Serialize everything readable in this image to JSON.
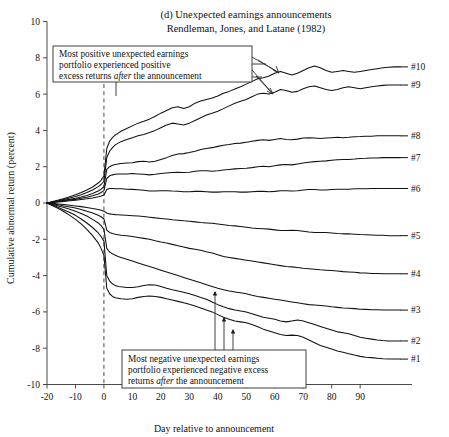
{
  "figure": {
    "panel_label": "(d) Unexpected earnings announcements",
    "citation": "Rendleman, Jones, and Latane (1982)"
  },
  "annotations": {
    "positive": {
      "line1": "Most positive unexpected earnings",
      "line2": "portfolio experienced positive",
      "line3_a": "excess returns ",
      "line3_em": "after",
      "line3_b": " the announcement"
    },
    "negative": {
      "line1": "Most negative unexpected earnings",
      "line2": "portfolio experienced negative excess",
      "line3_a": "returns ",
      "line3_em": "after",
      "line3_b": " the announcement"
    }
  },
  "chart_data": {
    "type": "line",
    "title": "(d) Unexpected earnings announcements",
    "subtitle": "Rendleman, Jones, and Latane (1982)",
    "xlabel": "Day relative to announcement",
    "ylabel": "Cumulative abnormal return (percent)",
    "xlim": [
      -20,
      104
    ],
    "ylim": [
      -10,
      10
    ],
    "xticks": [
      -20,
      -10,
      0,
      10,
      20,
      30,
      40,
      50,
      60,
      70,
      80,
      90
    ],
    "yticks": [
      -10,
      -8,
      -6,
      -4,
      -2,
      0,
      2,
      4,
      6,
      8,
      10
    ],
    "grid": false,
    "legend_position": "right-of-axis-inline",
    "event_marker": {
      "x": 0,
      "style": "dashed-vertical",
      "label": "announcement day"
    },
    "x": [
      -20,
      -18,
      -16,
      -14,
      -12,
      -10,
      -8,
      -6,
      -4,
      -2,
      -1,
      0,
      1,
      2,
      3,
      4,
      5,
      6,
      8,
      10,
      12,
      14,
      16,
      18,
      20,
      22,
      24,
      26,
      28,
      30,
      32,
      34,
      36,
      38,
      40,
      42,
      44,
      46,
      48,
      50,
      52,
      54,
      56,
      58,
      60,
      62,
      64,
      66,
      68,
      70,
      72,
      74,
      76,
      78,
      80,
      82,
      84,
      86,
      88,
      90,
      92,
      94,
      96,
      98,
      100,
      102,
      104
    ],
    "series": [
      {
        "name": "#10",
        "label": "#10",
        "end_value": 7.5,
        "values": [
          0.0,
          0.08,
          0.16,
          0.25,
          0.35,
          0.45,
          0.58,
          0.72,
          0.88,
          1.1,
          1.25,
          1.5,
          3.0,
          3.4,
          3.6,
          3.75,
          3.85,
          3.95,
          4.1,
          4.25,
          4.4,
          4.5,
          4.62,
          4.78,
          4.95,
          5.1,
          5.25,
          5.3,
          5.2,
          5.3,
          5.5,
          5.62,
          5.7,
          5.78,
          5.9,
          6.05,
          6.15,
          6.28,
          6.4,
          6.55,
          6.7,
          6.85,
          6.9,
          7.0,
          7.15,
          7.25,
          7.15,
          7.05,
          7.15,
          7.3,
          7.45,
          7.55,
          7.45,
          7.3,
          7.2,
          7.25,
          7.3,
          7.25,
          7.2,
          7.25,
          7.3,
          7.35,
          7.4,
          7.45,
          7.48,
          7.5,
          7.5
        ]
      },
      {
        "name": "#9",
        "label": "#9",
        "end_value": 6.5,
        "values": [
          0.0,
          0.06,
          0.12,
          0.2,
          0.28,
          0.36,
          0.46,
          0.58,
          0.72,
          0.9,
          1.02,
          1.2,
          2.5,
          2.85,
          3.05,
          3.2,
          3.3,
          3.38,
          3.5,
          3.6,
          3.7,
          3.78,
          3.88,
          4.0,
          4.15,
          4.3,
          4.4,
          4.35,
          4.3,
          4.4,
          4.55,
          4.7,
          4.85,
          4.95,
          5.05,
          5.2,
          5.35,
          5.5,
          5.6,
          5.7,
          5.85,
          6.0,
          6.05,
          6.0,
          6.1,
          6.25,
          6.2,
          6.1,
          6.15,
          6.3,
          6.4,
          6.45,
          6.35,
          6.25,
          6.2,
          6.25,
          6.35,
          6.4,
          6.35,
          6.3,
          6.35,
          6.4,
          6.45,
          6.48,
          6.5,
          6.5,
          6.5
        ]
      },
      {
        "name": "#8",
        "label": "#8",
        "end_value": 3.7,
        "values": [
          0.0,
          0.05,
          0.1,
          0.15,
          0.2,
          0.26,
          0.33,
          0.42,
          0.52,
          0.66,
          0.76,
          0.9,
          1.85,
          2.0,
          2.08,
          2.12,
          2.15,
          2.18,
          2.2,
          2.22,
          2.28,
          2.3,
          2.26,
          2.3,
          2.4,
          2.5,
          2.62,
          2.7,
          2.72,
          2.78,
          2.85,
          2.95,
          3.0,
          3.05,
          3.12,
          3.18,
          3.22,
          3.28,
          3.3,
          3.35,
          3.4,
          3.45,
          3.48,
          3.45,
          3.5,
          3.55,
          3.5,
          3.48,
          3.52,
          3.58,
          3.6,
          3.58,
          3.55,
          3.58,
          3.6,
          3.62,
          3.6,
          3.62,
          3.65,
          3.66,
          3.68,
          3.68,
          3.7,
          3.7,
          3.7,
          3.7,
          3.7
        ]
      },
      {
        "name": "#7",
        "label": "#7",
        "end_value": 2.5,
        "values": [
          0.0,
          0.04,
          0.08,
          0.12,
          0.16,
          0.2,
          0.26,
          0.32,
          0.4,
          0.5,
          0.58,
          0.68,
          1.35,
          1.5,
          1.55,
          1.58,
          1.6,
          1.6,
          1.6,
          1.62,
          1.6,
          1.58,
          1.55,
          1.58,
          1.62,
          1.65,
          1.68,
          1.7,
          1.68,
          1.7,
          1.75,
          1.78,
          1.78,
          1.75,
          1.78,
          1.82,
          1.85,
          1.88,
          1.9,
          1.92,
          1.95,
          2.0,
          2.02,
          2.0,
          2.05,
          2.1,
          2.12,
          2.1,
          2.15,
          2.2,
          2.25,
          2.28,
          2.3,
          2.32,
          2.35,
          2.38,
          2.4,
          2.4,
          2.42,
          2.45,
          2.46,
          2.48,
          2.48,
          2.5,
          2.5,
          2.5,
          2.5
        ]
      },
      {
        "name": "#6",
        "label": "#6",
        "end_value": 0.8,
        "values": [
          0.0,
          0.03,
          0.06,
          0.09,
          0.12,
          0.15,
          0.19,
          0.23,
          0.28,
          0.34,
          0.38,
          0.44,
          0.75,
          0.8,
          0.8,
          0.78,
          0.78,
          0.78,
          0.76,
          0.75,
          0.73,
          0.7,
          0.66,
          0.66,
          0.68,
          0.68,
          0.66,
          0.65,
          0.62,
          0.62,
          0.64,
          0.64,
          0.62,
          0.6,
          0.6,
          0.62,
          0.62,
          0.62,
          0.6,
          0.6,
          0.62,
          0.64,
          0.64,
          0.62,
          0.64,
          0.68,
          0.68,
          0.66,
          0.68,
          0.72,
          0.74,
          0.74,
          0.72,
          0.72,
          0.74,
          0.76,
          0.76,
          0.76,
          0.78,
          0.78,
          0.78,
          0.8,
          0.8,
          0.8,
          0.8,
          0.8,
          0.8
        ]
      },
      {
        "name": "#5",
        "label": "#5",
        "end_value": -1.8,
        "values": [
          0.0,
          -0.02,
          -0.05,
          -0.08,
          -0.12,
          -0.16,
          -0.2,
          -0.25,
          -0.3,
          -0.36,
          -0.4,
          -0.45,
          -0.55,
          -0.6,
          -0.62,
          -0.64,
          -0.65,
          -0.66,
          -0.68,
          -0.7,
          -0.72,
          -0.74,
          -0.78,
          -0.82,
          -0.85,
          -0.88,
          -0.92,
          -0.95,
          -0.98,
          -1.0,
          -1.04,
          -1.08,
          -1.1,
          -1.12,
          -1.16,
          -1.2,
          -1.24,
          -1.26,
          -1.3,
          -1.34,
          -1.38,
          -1.4,
          -1.42,
          -1.44,
          -1.48,
          -1.52,
          -1.52,
          -1.5,
          -1.52,
          -1.56,
          -1.6,
          -1.62,
          -1.62,
          -1.62,
          -1.65,
          -1.68,
          -1.7,
          -1.7,
          -1.72,
          -1.74,
          -1.75,
          -1.76,
          -1.78,
          -1.78,
          -1.8,
          -1.8,
          -1.8
        ]
      },
      {
        "name": "#4",
        "label": "#4",
        "end_value": -3.9,
        "values": [
          0.0,
          -0.05,
          -0.1,
          -0.16,
          -0.22,
          -0.28,
          -0.36,
          -0.45,
          -0.55,
          -0.68,
          -0.76,
          -0.88,
          -1.5,
          -1.62,
          -1.68,
          -1.72,
          -1.75,
          -1.78,
          -1.8,
          -1.85,
          -1.9,
          -1.95,
          -2.0,
          -2.08,
          -2.15,
          -2.2,
          -2.28,
          -2.35,
          -2.42,
          -2.5,
          -2.55,
          -2.6,
          -2.68,
          -2.75,
          -2.85,
          -2.95,
          -3.0,
          -3.05,
          -3.1,
          -3.15,
          -3.2,
          -3.25,
          -3.3,
          -3.35,
          -3.4,
          -3.45,
          -3.5,
          -3.52,
          -3.55,
          -3.6,
          -3.62,
          -3.65,
          -3.68,
          -3.7,
          -3.72,
          -3.75,
          -3.78,
          -3.8,
          -3.82,
          -3.85,
          -3.86,
          -3.88,
          -3.88,
          -3.9,
          -3.9,
          -3.9,
          -3.9
        ]
      },
      {
        "name": "#3",
        "label": "#3",
        "end_value": -5.9,
        "values": [
          0.0,
          -0.08,
          -0.16,
          -0.25,
          -0.35,
          -0.45,
          -0.58,
          -0.72,
          -0.9,
          -1.1,
          -1.25,
          -1.45,
          -2.5,
          -2.7,
          -2.8,
          -2.88,
          -2.95,
          -3.0,
          -3.1,
          -3.2,
          -3.3,
          -3.4,
          -3.5,
          -3.6,
          -3.7,
          -3.8,
          -3.9,
          -4.0,
          -4.1,
          -4.2,
          -4.3,
          -4.4,
          -4.5,
          -4.6,
          -4.7,
          -4.78,
          -4.85,
          -4.9,
          -4.95,
          -5.0,
          -5.08,
          -5.15,
          -5.2,
          -5.25,
          -5.3,
          -5.35,
          -5.4,
          -5.45,
          -5.5,
          -5.55,
          -5.6,
          -5.62,
          -5.65,
          -5.68,
          -5.72,
          -5.75,
          -5.78,
          -5.8,
          -5.82,
          -5.85,
          -5.86,
          -5.88,
          -5.88,
          -5.9,
          -5.9,
          -5.9,
          -5.9
        ]
      },
      {
        "name": "#2",
        "label": "#2",
        "end_value": -7.6,
        "values": [
          0.0,
          -0.12,
          -0.24,
          -0.38,
          -0.52,
          -0.68,
          -0.88,
          -1.1,
          -1.35,
          -1.65,
          -1.85,
          -2.1,
          -4.0,
          -4.3,
          -4.45,
          -4.55,
          -4.6,
          -4.62,
          -4.65,
          -4.66,
          -4.62,
          -4.55,
          -4.5,
          -4.52,
          -4.6,
          -4.7,
          -4.78,
          -4.85,
          -4.92,
          -5.0,
          -5.1,
          -5.2,
          -5.3,
          -5.45,
          -5.6,
          -5.72,
          -5.82,
          -5.9,
          -5.95,
          -6.0,
          -6.1,
          -6.2,
          -6.3,
          -6.35,
          -6.4,
          -6.5,
          -6.55,
          -6.5,
          -6.45,
          -6.5,
          -6.6,
          -6.7,
          -6.8,
          -6.9,
          -7.0,
          -7.1,
          -7.15,
          -7.2,
          -7.3,
          -7.4,
          -7.45,
          -7.5,
          -7.55,
          -7.58,
          -7.6,
          -7.6,
          -7.6
        ]
      },
      {
        "name": "#1",
        "label": "#1",
        "end_value": -8.6,
        "values": [
          0.0,
          -0.15,
          -0.3,
          -0.48,
          -0.68,
          -0.9,
          -1.15,
          -1.45,
          -1.8,
          -2.2,
          -2.5,
          -2.9,
          -4.7,
          -5.0,
          -5.15,
          -5.22,
          -5.25,
          -5.28,
          -5.3,
          -5.28,
          -5.2,
          -5.15,
          -5.12,
          -5.15,
          -5.2,
          -5.28,
          -5.35,
          -5.42,
          -5.5,
          -5.58,
          -5.68,
          -5.78,
          -5.9,
          -6.0,
          -6.15,
          -6.3,
          -6.4,
          -6.5,
          -6.55,
          -6.6,
          -6.7,
          -6.82,
          -6.95,
          -7.05,
          -7.15,
          -7.25,
          -7.3,
          -7.28,
          -7.3,
          -7.4,
          -7.55,
          -7.7,
          -7.85,
          -7.95,
          -8.05,
          -8.15,
          -8.22,
          -8.3,
          -8.38,
          -8.45,
          -8.5,
          -8.52,
          -8.55,
          -8.58,
          -8.6,
          -8.6,
          -8.6
        ]
      }
    ]
  }
}
